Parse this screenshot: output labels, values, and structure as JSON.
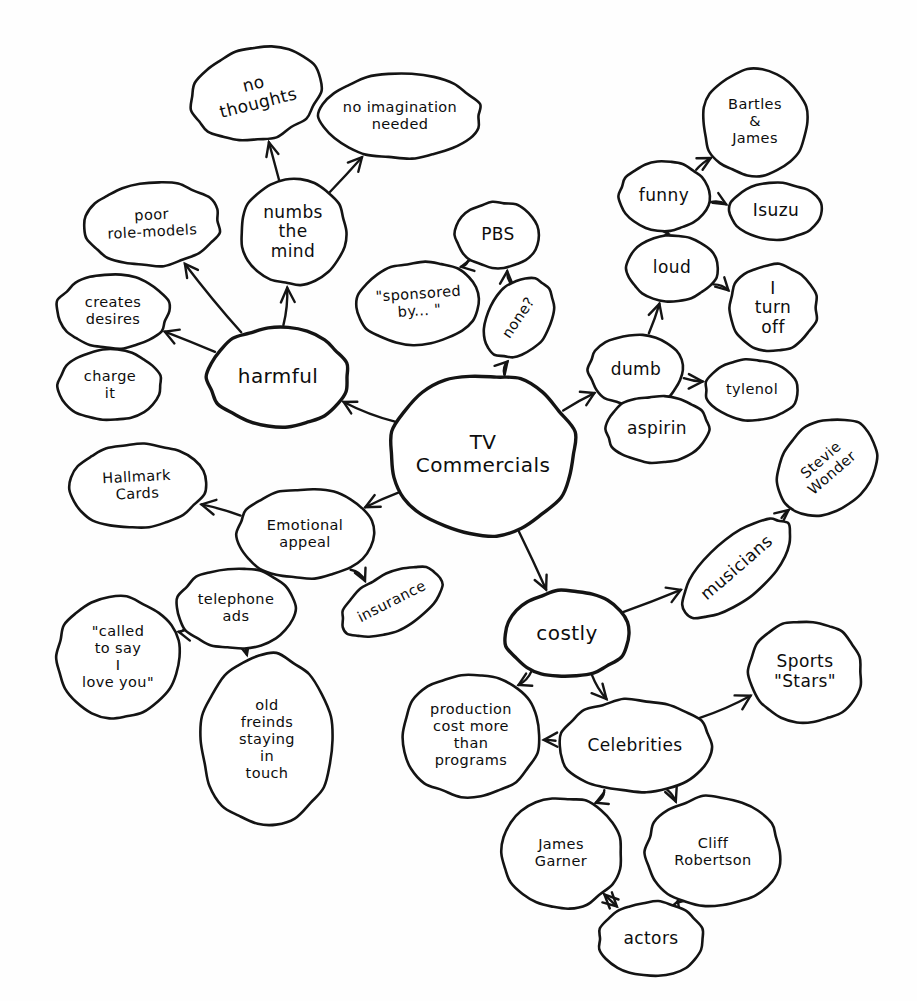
{
  "diagram": {
    "style": "hand-drawn ink on white paper",
    "ink_color": "#141414",
    "paper_color": "#fefefe"
  },
  "nodes": [
    {
      "id": "tv_commercials",
      "label": "TV Commercials",
      "lines": [
        "TV",
        "Commercials"
      ],
      "cx": 483,
      "cy": 455,
      "rx": 93,
      "ry": 81,
      "rot": 0,
      "size": "lg",
      "emphasis": "thick"
    },
    {
      "id": "harmful",
      "label": "harmful",
      "lines": [
        "harmful"
      ],
      "cx": 278,
      "cy": 377,
      "rx": 70,
      "ry": 50,
      "rot": 0,
      "size": "lg",
      "emphasis": "thick"
    },
    {
      "id": "numbs_the_mind",
      "label": "numbs the mind",
      "lines": [
        "numbs",
        "the",
        "mind"
      ],
      "cx": 293,
      "cy": 232,
      "rx": 53,
      "ry": 52,
      "rot": 0,
      "size": "md",
      "emphasis": "normal"
    },
    {
      "id": "no_thoughts",
      "label": "no thoughts",
      "lines": [
        "no",
        "thoughts"
      ],
      "cx": 256,
      "cy": 94,
      "rx": 65,
      "ry": 46,
      "rot": -14,
      "size": "md",
      "emphasis": "normal"
    },
    {
      "id": "no_imagination_needed",
      "label": "no imagination needed",
      "lines": [
        "no imagination",
        "needed"
      ],
      "cx": 400,
      "cy": 116,
      "rx": 81,
      "ry": 42,
      "rot": 0,
      "size": "sm",
      "emphasis": "normal"
    },
    {
      "id": "poor_role_models",
      "label": "poor role-models",
      "lines": [
        "poor",
        "role-models"
      ],
      "cx": 152,
      "cy": 224,
      "rx": 68,
      "ry": 42,
      "rot": -3,
      "size": "sm",
      "emphasis": "normal"
    },
    {
      "id": "creates_desires",
      "label": "creates desires",
      "lines": [
        "creates",
        "desires"
      ],
      "cx": 113,
      "cy": 311,
      "rx": 56,
      "ry": 37,
      "rot": 0,
      "size": "sm",
      "emphasis": "normal"
    },
    {
      "id": "charge_it",
      "label": "charge it",
      "lines": [
        "charge",
        "it"
      ],
      "cx": 110,
      "cy": 385,
      "rx": 52,
      "ry": 35,
      "rot": 0,
      "size": "sm",
      "emphasis": "normal"
    },
    {
      "id": "sponsored_by",
      "label": "\"sponsored by... \"",
      "lines": [
        "\"sponsored",
        "by... \""
      ],
      "cx": 419,
      "cy": 303,
      "rx": 62,
      "ry": 41,
      "rot": -4,
      "size": "sm",
      "emphasis": "normal"
    },
    {
      "id": "pbs",
      "label": "PBS",
      "lines": [
        "PBS"
      ],
      "cx": 498,
      "cy": 235,
      "rx": 42,
      "ry": 33,
      "rot": 0,
      "size": "md",
      "emphasis": "normal"
    },
    {
      "id": "none_q",
      "label": "none?",
      "lines": [
        "none?"
      ],
      "cx": 519,
      "cy": 318,
      "rx": 43,
      "ry": 31,
      "rot": -56,
      "size": "sm",
      "emphasis": "normal"
    },
    {
      "id": "dumb",
      "label": "dumb",
      "lines": [
        "dumb"
      ],
      "cx": 636,
      "cy": 370,
      "rx": 47,
      "ry": 36,
      "rot": 0,
      "size": "md",
      "emphasis": "normal"
    },
    {
      "id": "aspirin",
      "label": "aspirin",
      "lines": [
        "aspirin"
      ],
      "cx": 657,
      "cy": 429,
      "rx": 52,
      "ry": 33,
      "rot": 0,
      "size": "md",
      "emphasis": "normal"
    },
    {
      "id": "tylenol",
      "label": "tylenol",
      "lines": [
        "tylenol"
      ],
      "cx": 752,
      "cy": 390,
      "rx": 47,
      "ry": 30,
      "rot": 0,
      "size": "sm",
      "emphasis": "normal"
    },
    {
      "id": "loud",
      "label": "loud",
      "lines": [
        "loud"
      ],
      "cx": 672,
      "cy": 268,
      "rx": 45,
      "ry": 33,
      "rot": 0,
      "size": "md",
      "emphasis": "normal"
    },
    {
      "id": "i_turn_off",
      "label": "I turn off",
      "lines": [
        "I",
        "turn",
        "off"
      ],
      "cx": 773,
      "cy": 308,
      "rx": 44,
      "ry": 44,
      "rot": 0,
      "size": "md",
      "emphasis": "normal"
    },
    {
      "id": "funny",
      "label": "funny",
      "lines": [
        "funny"
      ],
      "cx": 664,
      "cy": 196,
      "rx": 45,
      "ry": 34,
      "rot": 0,
      "size": "md",
      "emphasis": "normal"
    },
    {
      "id": "isuzu",
      "label": "Isuzu",
      "lines": [
        "Isuzu"
      ],
      "cx": 776,
      "cy": 211,
      "rx": 47,
      "ry": 28,
      "rot": 0,
      "size": "md",
      "emphasis": "normal"
    },
    {
      "id": "bartles_james",
      "label": "Bartles & James",
      "lines": [
        "Bartles",
        "&",
        "James"
      ],
      "cx": 755,
      "cy": 122,
      "rx": 53,
      "ry": 53,
      "rot": 0,
      "size": "sm",
      "emphasis": "normal"
    },
    {
      "id": "emotional_appeal",
      "label": "Emotional appeal",
      "lines": [
        "Emotional",
        "appeal"
      ],
      "cx": 305,
      "cy": 534,
      "rx": 68,
      "ry": 45,
      "rot": 0,
      "size": "sm",
      "emphasis": "normal"
    },
    {
      "id": "hallmark_cards",
      "label": "Hallmark Cards",
      "lines": [
        "Hallmark",
        "Cards"
      ],
      "cx": 137,
      "cy": 486,
      "rx": 68,
      "ry": 42,
      "rot": -3,
      "size": "sm",
      "emphasis": "normal"
    },
    {
      "id": "insurance",
      "label": "insurance",
      "lines": [
        "insurance"
      ],
      "cx": 392,
      "cy": 602,
      "rx": 55,
      "ry": 28,
      "rot": -27,
      "size": "sm",
      "emphasis": "normal"
    },
    {
      "id": "telephone_ads",
      "label": "telephone ads",
      "lines": [
        "telephone",
        "ads"
      ],
      "cx": 236,
      "cy": 608,
      "rx": 59,
      "ry": 40,
      "rot": 0,
      "size": "sm",
      "emphasis": "normal"
    },
    {
      "id": "called_to_say",
      "label": "\"called to say I love you\"",
      "lines": [
        "\"called",
        "to say",
        "I",
        "love you\""
      ],
      "cx": 118,
      "cy": 657,
      "rx": 62,
      "ry": 60,
      "rot": 0,
      "size": "sm",
      "emphasis": "normal"
    },
    {
      "id": "old_friends",
      "label": "old freinds staying in touch",
      "lines": [
        "old",
        "freinds",
        "staying",
        "in",
        "touch"
      ],
      "cx": 267,
      "cy": 740,
      "rx": 67,
      "ry": 85,
      "rot": 0,
      "size": "sm",
      "emphasis": "normal"
    },
    {
      "id": "costly",
      "label": "costly",
      "lines": [
        "costly"
      ],
      "cx": 567,
      "cy": 634,
      "rx": 62,
      "ry": 43,
      "rot": 0,
      "size": "lg",
      "emphasis": "thick"
    },
    {
      "id": "musicians",
      "label": "musicians",
      "lines": [
        "musicians"
      ],
      "cx": 737,
      "cy": 568,
      "rx": 67,
      "ry": 30,
      "rot": -41,
      "size": "md",
      "emphasis": "normal"
    },
    {
      "id": "stevie_wonder",
      "label": "Stevie Wonder",
      "lines": [
        "Stevie",
        "Wonder"
      ],
      "cx": 827,
      "cy": 467,
      "rx": 54,
      "ry": 44,
      "rot": -41,
      "size": "sm",
      "emphasis": "normal"
    },
    {
      "id": "production_cost",
      "label": "production cost more than programs",
      "lines": [
        "production",
        "cost more",
        "than",
        "programs"
      ],
      "cx": 471,
      "cy": 735,
      "rx": 69,
      "ry": 62,
      "rot": 0,
      "size": "sm",
      "emphasis": "normal"
    },
    {
      "id": "celebrities",
      "label": "Celebrities",
      "lines": [
        "Celebrities"
      ],
      "cx": 635,
      "cy": 746,
      "rx": 78,
      "ry": 46,
      "rot": 0,
      "size": "md",
      "emphasis": "normal"
    },
    {
      "id": "sports_stars",
      "label": "Sports \"Stars\"",
      "lines": [
        "Sports",
        "\"Stars\""
      ],
      "cx": 805,
      "cy": 672,
      "rx": 56,
      "ry": 52,
      "rot": 0,
      "size": "md",
      "emphasis": "normal"
    },
    {
      "id": "james_garner",
      "label": "James Garner",
      "lines": [
        "James",
        "Garner"
      ],
      "cx": 561,
      "cy": 853,
      "rx": 60,
      "ry": 56,
      "rot": 0,
      "size": "sm",
      "emphasis": "normal"
    },
    {
      "id": "cliff_robertson",
      "label": "Cliff Robertson",
      "lines": [
        "Cliff",
        "Robertson"
      ],
      "cx": 713,
      "cy": 852,
      "rx": 68,
      "ry": 55,
      "rot": 0,
      "size": "sm",
      "emphasis": "normal"
    },
    {
      "id": "actors",
      "label": "actors",
      "lines": [
        "actors"
      ],
      "cx": 651,
      "cy": 939,
      "rx": 52,
      "ry": 37,
      "rot": 0,
      "size": "md",
      "emphasis": "normal"
    }
  ],
  "edges": [
    {
      "from": "tv_commercials",
      "to": "harmful",
      "arrow": "to"
    },
    {
      "from": "tv_commercials",
      "to": "none_q",
      "arrow": "to"
    },
    {
      "from": "tv_commercials",
      "to": "dumb",
      "arrow": "to"
    },
    {
      "from": "tv_commercials",
      "to": "emotional_appeal",
      "arrow": "to"
    },
    {
      "from": "tv_commercials",
      "to": "costly",
      "arrow": "to"
    },
    {
      "from": "harmful",
      "to": "numbs_the_mind",
      "arrow": "to"
    },
    {
      "from": "harmful",
      "to": "poor_role_models",
      "arrow": "to"
    },
    {
      "from": "harmful",
      "to": "creates_desires",
      "arrow": "to"
    },
    {
      "from": "numbs_the_mind",
      "to": "no_thoughts",
      "arrow": "to"
    },
    {
      "from": "numbs_the_mind",
      "to": "no_imagination_needed",
      "arrow": "to"
    },
    {
      "from": "creates_desires",
      "to": "charge_it",
      "arrow": "to"
    },
    {
      "from": "none_q",
      "to": "pbs",
      "arrow": "to"
    },
    {
      "from": "pbs",
      "to": "sponsored_by",
      "arrow": "to"
    },
    {
      "from": "dumb",
      "to": "aspirin",
      "arrow": "to"
    },
    {
      "from": "dumb",
      "to": "tylenol",
      "arrow": "to"
    },
    {
      "from": "dumb",
      "to": "loud",
      "arrow": "to"
    },
    {
      "from": "loud",
      "to": "i_turn_off",
      "arrow": "to"
    },
    {
      "from": "loud",
      "to": "funny",
      "arrow": "to"
    },
    {
      "from": "funny",
      "to": "isuzu",
      "arrow": "to"
    },
    {
      "from": "funny",
      "to": "bartles_james",
      "arrow": "to"
    },
    {
      "from": "emotional_appeal",
      "to": "hallmark_cards",
      "arrow": "to"
    },
    {
      "from": "emotional_appeal",
      "to": "insurance",
      "arrow": "to"
    },
    {
      "from": "emotional_appeal",
      "to": "telephone_ads",
      "arrow": "to"
    },
    {
      "from": "telephone_ads",
      "to": "called_to_say",
      "arrow": "to"
    },
    {
      "from": "telephone_ads",
      "to": "old_friends",
      "arrow": "to"
    },
    {
      "from": "costly",
      "to": "musicians",
      "arrow": "to"
    },
    {
      "from": "musicians",
      "to": "stevie_wonder",
      "arrow": "to"
    },
    {
      "from": "costly",
      "to": "production_cost",
      "arrow": "to"
    },
    {
      "from": "costly",
      "to": "celebrities",
      "arrow": "to"
    },
    {
      "from": "celebrities",
      "to": "production_cost",
      "arrow": "to"
    },
    {
      "from": "celebrities",
      "to": "sports_stars",
      "arrow": "to"
    },
    {
      "from": "celebrities",
      "to": "james_garner",
      "arrow": "to"
    },
    {
      "from": "celebrities",
      "to": "cliff_robertson",
      "arrow": "to"
    },
    {
      "from": "james_garner",
      "to": "actors",
      "arrow": "both"
    },
    {
      "from": "cliff_robertson",
      "to": "actors",
      "arrow": "both"
    }
  ]
}
